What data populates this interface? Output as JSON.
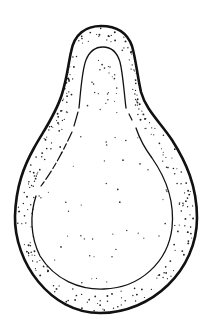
{
  "figure": {
    "background": "#ffffff",
    "ink": "#111111",
    "outer_outline": {
      "stroke_width": 2.6,
      "path": "M101 26 C86 26 74 34 71 52 C68 66 67 78 62 94 C56 114 44 130 34 148 C24 166 16 186 15 216 C14 262 50 313 100 313 C152 313 197 270 197 218 C197 186 186 162 172 140 C160 122 146 110 141 92 C137 74 136 60 132 46 C127 32 116 26 101 26 Z"
    },
    "inner_outline": {
      "stroke_width": 1.3,
      "path_left": "M79 108 C81 88 82 70 86 60 C90 50 96 47 103 47 C111 47 117 52 120 62 C123 74 124 92 126 108",
      "path_dash_left": "M78 112 L74 126",
      "path_dash_left2": "M72 132 C60 158 50 174 41 186",
      "path_lower": "M36 196 C30 214 30 236 40 256 C55 280 80 290 104 289 C140 288 168 262 172 228 C175 200 166 178 152 158 C146 150 140 140 136 128",
      "path_dash_right": "M132 120 L129 114"
    },
    "stipple": {
      "seed": 7,
      "wall_density": 260,
      "interior_density": 70,
      "dot_radius": 0.75
    }
  }
}
